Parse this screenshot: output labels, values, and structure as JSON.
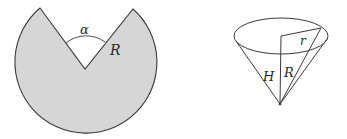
{
  "figure": {
    "left": {
      "description": "circular sector with removed wedge",
      "fill": "#d6d6d6",
      "stroke": "#3a3a3a",
      "labels": {
        "angle": "α",
        "radius": "R"
      }
    },
    "right": {
      "description": "cone formed from sector",
      "stroke": "#3a3a3a",
      "labels": {
        "height": "H",
        "slant": "R",
        "base_radius": "r"
      }
    }
  }
}
